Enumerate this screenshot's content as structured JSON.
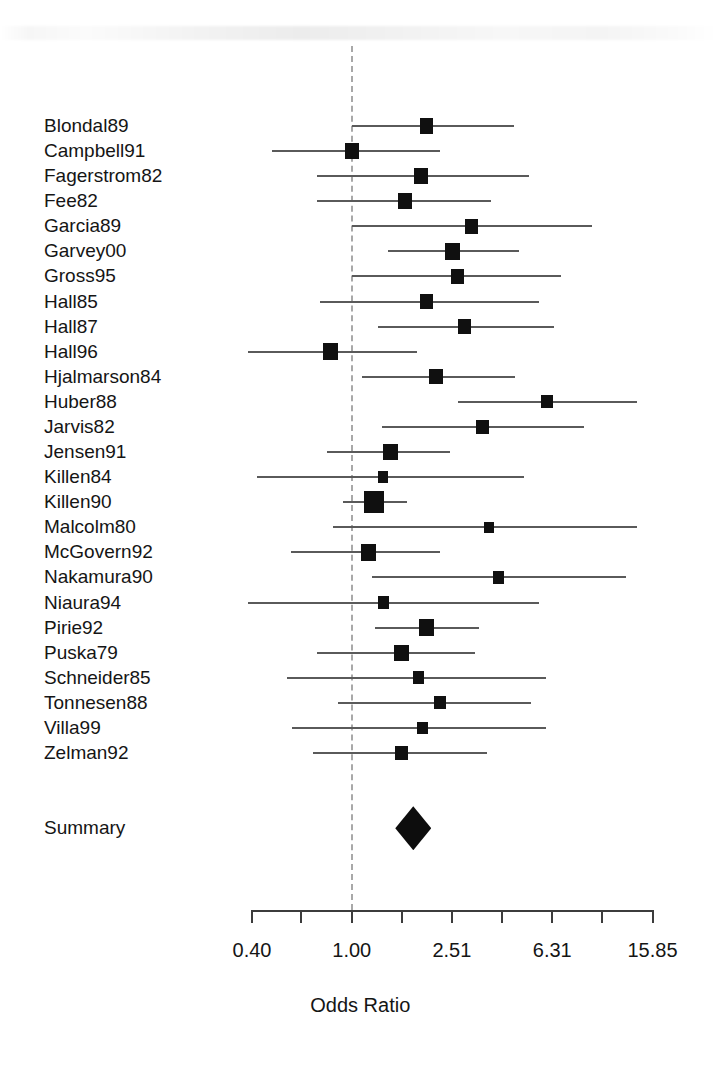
{
  "figure": {
    "type": "forest-plot",
    "axis_title": "Odds Ratio",
    "summary_label": "Summary",
    "null_value": 1.0
  },
  "axis": {
    "scale": "log",
    "min": 0.4,
    "max": 15.85,
    "tick_values": [
      0.4,
      0.63,
      1.0,
      1.59,
      2.51,
      3.98,
      6.31,
      10.0,
      15.85
    ],
    "tick_labels": [
      "0.40",
      "",
      "1.00",
      "",
      "2.51",
      "",
      "6.31",
      "",
      "15.85"
    ],
    "labeled_ticks": [
      "0.40",
      "1.00",
      "2.51",
      "6.31",
      "15.85"
    ]
  },
  "chart_data": {
    "type": "forest",
    "title": "",
    "xlabel": "Odds Ratio",
    "ylabel": "",
    "xscale": "log",
    "xlim": [
      0.4,
      15.85
    ],
    "xticks": [
      0.4,
      0.63,
      1.0,
      1.59,
      2.51,
      3.98,
      6.31,
      10.0,
      15.85
    ],
    "xticklabels": [
      "0.40",
      "",
      "1.00",
      "",
      "2.51",
      "",
      "6.31",
      "",
      "15.85"
    ],
    "grid": false,
    "reference_line": 1.0,
    "legend": "",
    "categories": [
      "Blondal89",
      "Campbell91",
      "Fagerstrom82",
      "Fee82",
      "Garcia89",
      "Garvey00",
      "Gross95",
      "Hall85",
      "Hall87",
      "Hall96",
      "Hjalmarson84",
      "Huber88",
      "Jarvis82",
      "Jensen91",
      "Killen84",
      "Killen90",
      "Malcolm80",
      "McGovern92",
      "Nakamura90",
      "Niaura94",
      "Pirie92",
      "Puska79",
      "Schneider85",
      "Tonnesen88",
      "Villa99",
      "Zelman92"
    ],
    "studies": [
      {
        "label": "Blondal89",
        "or": 1.99,
        "ci_low": 1.0,
        "ci_high": 4.45,
        "weight": 0.55
      },
      {
        "label": "Campbell91",
        "or": 1.0,
        "ci_low": 0.48,
        "ci_high": 2.26,
        "weight": 0.55
      },
      {
        "label": "Fagerstrom82",
        "or": 1.89,
        "ci_low": 0.73,
        "ci_high": 5.08,
        "weight": 0.6
      },
      {
        "label": "Fee82",
        "or": 1.63,
        "ci_low": 0.73,
        "ci_high": 3.61,
        "weight": 0.6
      },
      {
        "label": "Garcia89",
        "or": 3.01,
        "ci_low": 1.0,
        "ci_high": 9.11,
        "weight": 0.5
      },
      {
        "label": "Garvey00",
        "or": 2.53,
        "ci_low": 1.4,
        "ci_high": 4.63,
        "weight": 0.65
      },
      {
        "label": "Gross95",
        "or": 2.64,
        "ci_low": 1.0,
        "ci_high": 6.85,
        "weight": 0.5
      },
      {
        "label": "Hall85",
        "or": 1.99,
        "ci_low": 0.75,
        "ci_high": 5.57,
        "weight": 0.55
      },
      {
        "label": "Hall87",
        "or": 2.82,
        "ci_low": 1.27,
        "ci_high": 6.4,
        "weight": 0.55
      },
      {
        "label": "Hall96",
        "or": 0.82,
        "ci_low": 0.33,
        "ci_high": 1.82,
        "weight": 0.65
      },
      {
        "label": "Hjalmarson84",
        "or": 2.17,
        "ci_low": 1.1,
        "ci_high": 4.5,
        "weight": 0.55
      },
      {
        "label": "Huber88",
        "or": 6.0,
        "ci_low": 2.66,
        "ci_high": 13.8,
        "weight": 0.4
      },
      {
        "label": "Jarvis82",
        "or": 3.33,
        "ci_low": 1.32,
        "ci_high": 8.44,
        "weight": 0.5
      },
      {
        "label": "Jensen91",
        "or": 1.43,
        "ci_low": 0.8,
        "ci_high": 2.47,
        "weight": 0.6
      },
      {
        "label": "Killen84",
        "or": 1.33,
        "ci_low": 0.42,
        "ci_high": 4.89,
        "weight": 0.3
      },
      {
        "label": "Killen90",
        "or": 1.23,
        "ci_low": 0.92,
        "ci_high": 1.66,
        "weight": 1.0
      },
      {
        "label": "Malcolm80",
        "or": 3.52,
        "ci_low": 0.84,
        "ci_high": 13.8,
        "weight": 0.28
      },
      {
        "label": "McGovern92",
        "or": 1.17,
        "ci_low": 0.57,
        "ci_high": 2.26,
        "weight": 0.62
      },
      {
        "label": "Nakamura90",
        "or": 3.85,
        "ci_low": 1.2,
        "ci_high": 12.4,
        "weight": 0.4
      },
      {
        "label": "Niaura94",
        "or": 1.34,
        "ci_low": 0.38,
        "ci_high": 5.57,
        "weight": 0.34
      },
      {
        "label": "Pirie92",
        "or": 1.99,
        "ci_low": 1.24,
        "ci_high": 3.22,
        "weight": 0.62
      },
      {
        "label": "Puska79",
        "or": 1.58,
        "ci_low": 0.73,
        "ci_high": 3.11,
        "weight": 0.6
      },
      {
        "label": "Schneider85",
        "or": 1.85,
        "ci_low": 0.55,
        "ci_high": 5.95,
        "weight": 0.38
      },
      {
        "label": "Tonnesen88",
        "or": 2.25,
        "ci_low": 0.88,
        "ci_high": 5.2,
        "weight": 0.42
      },
      {
        "label": "Villa99",
        "or": 1.91,
        "ci_low": 0.58,
        "ci_high": 5.95,
        "weight": 0.38
      },
      {
        "label": "Zelman92",
        "or": 1.58,
        "ci_low": 0.7,
        "ci_high": 3.45,
        "weight": 0.5
      }
    ],
    "summary": {
      "label": "Summary",
      "or": 1.76,
      "ci_low": 1.54,
      "ci_high": 2.01
    }
  }
}
